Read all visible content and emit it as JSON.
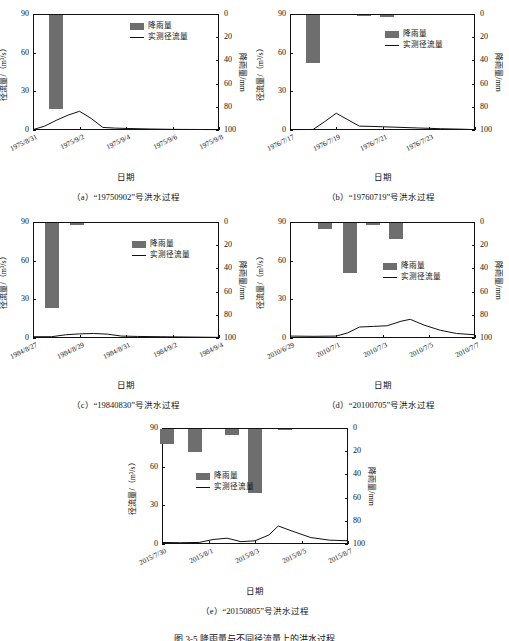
{
  "figure": {
    "caption": "图 3-5   降雨量与不同径流量上的洪水过程",
    "axis_x_label": "日期",
    "axis_y_left_label": "径流量/（m³/s）",
    "axis_y_right_label": "降雨量/mm",
    "legend": {
      "rainfall": "降雨量",
      "runoff": "实测径流量"
    },
    "colors": {
      "bar": "#6e6e6e",
      "line": "#111111",
      "axis": "#111111",
      "background": "#ffffff"
    }
  },
  "chart_data": [
    {
      "id": "a",
      "type": "bar",
      "title": "（a）“19750902”号洪水过程",
      "xlabel": "日期",
      "ylabel": "径流量/（m³/s）",
      "y2label": "降雨量/mm",
      "ylim": [
        0,
        90
      ],
      "yticks": [
        0,
        30,
        60,
        90
      ],
      "y2lim": [
        100,
        0
      ],
      "y2ticks": [
        0,
        20,
        40,
        60,
        80,
        100
      ],
      "xlim": [
        0,
        8
      ],
      "xticks": [
        0,
        2,
        4,
        6,
        8
      ],
      "xticklabels": [
        "1975/8/31",
        "1975/9/2",
        "1975/9/4",
        "1975/9/6",
        "1975/9/8"
      ],
      "grid": false,
      "legend_position": "top-right",
      "series": [
        {
          "name": "降雨量",
          "type": "bar",
          "unit": "mm",
          "axis": "right",
          "x": [
            1.0
          ],
          "values": [
            81.0
          ]
        },
        {
          "name": "实测径流量",
          "type": "line",
          "unit": "m³/s",
          "axis": "left",
          "x": [
            0.0,
            0.5,
            1.0,
            1.5,
            2.0,
            2.5,
            3.0,
            3.5,
            4.0,
            5.0,
            6.0,
            7.0,
            8.0
          ],
          "values": [
            0.3,
            3.0,
            7.5,
            11.5,
            14.5,
            9.0,
            2.0,
            1.5,
            1.2,
            0.8,
            0.5,
            0.4,
            0.3
          ]
        }
      ]
    },
    {
      "id": "b",
      "type": "bar",
      "title": "（b）“19760719”号洪水过程",
      "xlabel": "日期",
      "ylabel": "径流量/（m³/s）",
      "y2label": "降雨量/mm",
      "ylim": [
        0,
        90
      ],
      "yticks": [
        0,
        30,
        60,
        90
      ],
      "y2lim": [
        100,
        0
      ],
      "y2ticks": [
        0,
        20,
        40,
        60,
        80,
        100
      ],
      "xlim": [
        0,
        8
      ],
      "xticks": [
        0,
        2,
        4,
        6,
        8
      ],
      "xticklabels": [
        "1976/7/17",
        "1976/7/19",
        "1976/7/21",
        "1976/7/23",
        ""
      ],
      "grid": false,
      "legend_position": "top-right",
      "series": [
        {
          "name": "降雨量",
          "type": "bar",
          "unit": "mm",
          "axis": "right",
          "x": [
            1.0,
            3.2,
            4.2
          ],
          "values": [
            41.0,
            1.0,
            2.0
          ]
        },
        {
          "name": "实测径流量",
          "type": "line",
          "unit": "m³/s",
          "axis": "left",
          "x": [
            0.0,
            1.0,
            1.5,
            2.0,
            2.5,
            3.0,
            3.5,
            4.0,
            4.5,
            5.5,
            6.5,
            7.5,
            8.0
          ],
          "values": [
            0.3,
            0.4,
            6.5,
            13.0,
            8.0,
            3.0,
            2.8,
            2.5,
            2.2,
            1.6,
            1.0,
            0.6,
            0.3
          ]
        }
      ]
    },
    {
      "id": "c",
      "type": "bar",
      "title": "（c）“19840830”号洪水过程",
      "xlabel": "日期",
      "ylabel": "径流量/（m³/s）",
      "y2label": "降雨量/mm",
      "ylim": [
        0,
        90
      ],
      "yticks": [
        0,
        30,
        60,
        90
      ],
      "y2lim": [
        100,
        0
      ],
      "y2ticks": [
        0,
        20,
        40,
        60,
        80,
        100
      ],
      "xlim": [
        0,
        8
      ],
      "xticks": [
        0,
        2,
        4,
        6,
        8
      ],
      "xticklabels": [
        "1984/8/27",
        "1984/8/29",
        "1984/8/31",
        "1984/9/2",
        "1984/9/4"
      ],
      "grid": false,
      "legend_position": "top-right",
      "series": [
        {
          "name": "降雨量",
          "type": "bar",
          "unit": "mm",
          "axis": "right",
          "x": [
            0.8,
            1.9
          ],
          "values": [
            73.0,
            1.5
          ]
        },
        {
          "name": "实测径流量",
          "type": "line",
          "unit": "m³/s",
          "axis": "left",
          "x": [
            0.0,
            0.8,
            1.4,
            2.0,
            2.6,
            3.2,
            3.8,
            4.5,
            5.5,
            6.5,
            7.5,
            8.0
          ],
          "values": [
            1.0,
            1.0,
            2.5,
            3.2,
            3.5,
            3.0,
            1.5,
            1.2,
            1.0,
            0.8,
            0.6,
            0.5
          ]
        }
      ]
    },
    {
      "id": "d",
      "type": "bar",
      "title": "（d）“20100705”号洪水过程",
      "xlabel": "日期",
      "ylabel": "径流量/（m³/s）",
      "y2label": "降雨量/mm",
      "ylim": [
        0,
        90
      ],
      "yticks": [
        0,
        30,
        60,
        90
      ],
      "y2lim": [
        100,
        0
      ],
      "y2ticks": [
        0,
        20,
        40,
        60,
        80,
        100
      ],
      "xlim": [
        0,
        8
      ],
      "xticks": [
        0,
        2,
        4,
        6,
        8
      ],
      "xticklabels": [
        "2010/6/29",
        "2010/7/1",
        "2010/7/3",
        "2010/7/5",
        "2010/7/7"
      ],
      "grid": false,
      "legend_position": "center-right",
      "series": [
        {
          "name": "降雨量",
          "type": "bar",
          "unit": "mm",
          "axis": "right",
          "x": [
            1.5,
            2.6,
            3.6,
            4.6
          ],
          "values": [
            5.0,
            43.0,
            2.0,
            14.0
          ]
        },
        {
          "name": "实测径流量",
          "type": "line",
          "unit": "m³/s",
          "axis": "left",
          "x": [
            0.0,
            1.0,
            2.0,
            2.5,
            3.0,
            3.6,
            4.2,
            4.8,
            5.2,
            5.8,
            6.5,
            7.2,
            8.0
          ],
          "values": [
            1.5,
            1.3,
            1.5,
            4.0,
            8.5,
            9.0,
            9.5,
            13.0,
            14.5,
            10.0,
            6.0,
            3.5,
            2.5
          ]
        }
      ]
    },
    {
      "id": "e",
      "type": "bar",
      "title": "（e）“20150805”号洪水过程",
      "xlabel": "日期",
      "ylabel": "径流量/（m³/s）",
      "y2label": "降雨量/mm",
      "ylim": [
        0,
        90
      ],
      "yticks": [
        0,
        30,
        60,
        90
      ],
      "y2lim": [
        100,
        0
      ],
      "y2ticks": [
        0,
        20,
        40,
        60,
        80,
        100
      ],
      "xlim": [
        0,
        8
      ],
      "xticks": [
        0,
        2,
        4,
        6,
        8
      ],
      "xticklabels": [
        "2015/7/30",
        "2015/8/1",
        "2015/8/3",
        "2015/8/5",
        "2015/8/7"
      ],
      "grid": false,
      "legend_position": "center-left",
      "series": [
        {
          "name": "降雨量",
          "type": "bar",
          "unit": "mm",
          "axis": "right",
          "x": [
            0.2,
            1.4,
            3.0,
            4.0,
            5.3
          ],
          "values": [
            13.0,
            20.0,
            5.0,
            55.0,
            1.0
          ]
        },
        {
          "name": "实测径流量",
          "type": "line",
          "unit": "m³/s",
          "axis": "left",
          "x": [
            0.0,
            0.8,
            1.6,
            2.2,
            2.8,
            3.4,
            4.0,
            4.6,
            5.0,
            5.6,
            6.4,
            7.2,
            8.0
          ],
          "values": [
            1.2,
            1.0,
            1.2,
            3.5,
            4.5,
            1.8,
            2.5,
            7.0,
            14.0,
            10.0,
            5.0,
            3.0,
            2.5
          ]
        }
      ]
    }
  ]
}
